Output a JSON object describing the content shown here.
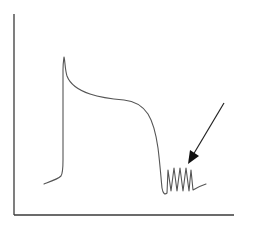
{
  "diagram": {
    "type": "action-potential-schematic",
    "axes": {
      "y_axis": {
        "x": 14,
        "y_top": 14,
        "y_bottom": 215,
        "label": ""
      },
      "x_axis": {
        "y": 215,
        "x_left": 14,
        "x_right": 234,
        "label": ""
      }
    },
    "colors": {
      "axis": "#3a3a3a",
      "trace": "#555555",
      "arrow": "#222222",
      "background": "#ffffff"
    },
    "trace": {
      "baseline_start": [
        44,
        184
      ],
      "upstroke_x": 63,
      "peak": [
        64,
        57
      ],
      "plateau_level_y": 100,
      "repolarization_end": [
        163,
        194
      ],
      "oscillation_count": 5,
      "oscillation_range_x": [
        166,
        188
      ],
      "oscillation_peak_y": 168,
      "oscillation_trough_y": 191,
      "tail_end": [
        206,
        184
      ]
    },
    "annotation_arrow": {
      "from": [
        224,
        103
      ],
      "to": [
        188,
        163
      ],
      "points_to": "afterdepolarization oscillations"
    }
  }
}
